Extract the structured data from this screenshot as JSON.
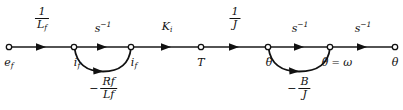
{
  "figure": {
    "line_color": "#1a1a1a",
    "text_color": "#111111",
    "width": 403,
    "height": 110
  },
  "nodes": [
    {
      "id": "ef",
      "label_main": "e",
      "label_sub": "f",
      "dots": "",
      "x": 9,
      "y": 47
    },
    {
      "id": "if1",
      "label_main": "i",
      "label_sub": "f",
      "dots": "",
      "x": 74,
      "y": 47
    },
    {
      "id": "if2",
      "label_main": "i",
      "label_sub": "f",
      "dots": "",
      "x": 131,
      "y": 47
    },
    {
      "id": "T",
      "label_main": "T",
      "label_sub": "",
      "dots": "",
      "x": 201,
      "y": 47
    },
    {
      "id": "thetadd",
      "label_main": "θ",
      "label_sub": "",
      "dots": "..",
      "x": 268,
      "y": 47
    },
    {
      "id": "thetad",
      "label_main": "θ",
      "label_sub": "",
      "dots": ".",
      "x": 330,
      "y": 47
    },
    {
      "id": "theta",
      "label_main": "θ",
      "label_sub": "",
      "dots": "",
      "x": 395,
      "y": 47
    }
  ],
  "node_labels": [
    {
      "name": "node-label-ef",
      "text": "e_f",
      "x": 9,
      "y": 57
    },
    {
      "name": "node-label-if-1",
      "text": "i_f",
      "x": 76,
      "y": 57
    },
    {
      "name": "node-label-if-2",
      "text": "i_f",
      "x": 133,
      "y": 57
    },
    {
      "name": "node-label-T",
      "text": "T",
      "x": 201,
      "y": 57
    },
    {
      "name": "node-label-theta-dd",
      "text": "θ̈",
      "x": 268,
      "y": 57
    },
    {
      "name": "node-label-omega",
      "text": "θ̇ = ω",
      "x": 336,
      "y": 57
    },
    {
      "name": "node-label-theta",
      "text": "θ",
      "x": 395,
      "y": 57
    }
  ],
  "branches": [
    {
      "name": "branch-ef-to-if1",
      "from": "ef",
      "to": "if1",
      "gain_type": "fraction",
      "numerator": "1",
      "denominator": "L",
      "denominator_sub": "f",
      "label_x": 42,
      "label_y": 7
    },
    {
      "name": "branch-if1-to-if2",
      "from": "if1",
      "to": "if2",
      "gain_type": "power",
      "base": "s",
      "exponent": "−1",
      "label_x": 103,
      "label_y": 22
    },
    {
      "name": "branch-if2-to-T",
      "from": "if2",
      "to": "T",
      "gain_type": "symbol",
      "base": "K",
      "sub": "i",
      "label_x": 167,
      "label_y": 22
    },
    {
      "name": "branch-T-to-thetadd",
      "from": "T",
      "to": "thetadd",
      "gain_type": "fraction",
      "numerator": "1",
      "denominator": "J",
      "denominator_sub": "",
      "label_x": 235,
      "label_y": 7
    },
    {
      "name": "branch-thetadd-to-thetad",
      "from": "thetadd",
      "to": "thetad",
      "gain_type": "power",
      "base": "s",
      "exponent": "−1",
      "label_x": 300,
      "label_y": 22
    },
    {
      "name": "branch-thetad-to-theta",
      "from": "thetad",
      "to": "theta",
      "gain_type": "power",
      "base": "s",
      "exponent": "−1",
      "label_x": 363,
      "label_y": 22
    }
  ],
  "feedback_loops": [
    {
      "name": "feedback-loop-field",
      "from": "if2",
      "to": "if1",
      "sign": "−",
      "numerator": "R",
      "numerator_sub": "f",
      "denominator": "L",
      "denominator_sub": "f",
      "label_x": 103,
      "label_y": 76
    },
    {
      "name": "feedback-loop-damping",
      "from": "thetad",
      "to": "thetadd",
      "sign": "−",
      "numerator": "B",
      "numerator_sub": "",
      "denominator": "J",
      "denominator_sub": "",
      "label_x": 299,
      "label_y": 76
    }
  ],
  "arrowheads": [
    {
      "name": "arrowhead-branch-1",
      "x": 42,
      "y": 47
    },
    {
      "name": "arrowhead-branch-2",
      "x": 103,
      "y": 47
    },
    {
      "name": "arrowhead-branch-3",
      "x": 167,
      "y": 47
    },
    {
      "name": "arrowhead-branch-4",
      "x": 235,
      "y": 47
    },
    {
      "name": "arrowhead-branch-5",
      "x": 300,
      "y": 47
    },
    {
      "name": "arrowhead-branch-6",
      "x": 363,
      "y": 47
    },
    {
      "name": "arrowhead-feedback-1",
      "x": 103,
      "y": 71
    },
    {
      "name": "arrowhead-feedback-2",
      "x": 299,
      "y": 71
    }
  ]
}
